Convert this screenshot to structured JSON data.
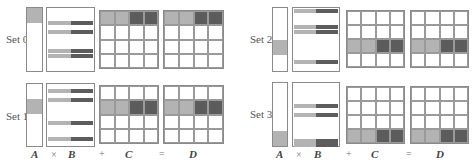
{
  "diagram": {
    "colors": {
      "light": "#b3b3b3",
      "dark": "#5c5c5c",
      "border": "#8a8a8a"
    },
    "footer": {
      "A": "A",
      "times": "×",
      "B": "B",
      "plus": "+",
      "C": "C",
      "equals": "=",
      "D": "D"
    },
    "sets": [
      {
        "label": "Set 0",
        "a_highlight_row": 0,
        "cd_highlight_row": 0
      },
      {
        "label": "Set 1",
        "a_highlight_row": 1,
        "cd_highlight_row": 1
      },
      {
        "label": "Set 2",
        "a_highlight_row": 2,
        "cd_highlight_row": 2
      },
      {
        "label": "Set 3",
        "a_highlight_row": 3,
        "cd_highlight_row": 3
      }
    ]
  }
}
